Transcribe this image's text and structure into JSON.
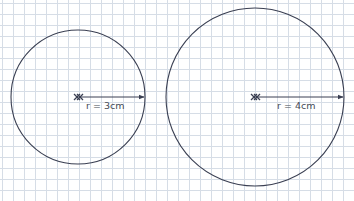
{
  "diagram": {
    "background": "grid-paper",
    "grid_color": "#d6dde6",
    "line_color": "#3a3f52",
    "circles": [
      {
        "name": "small-circle",
        "center": [
          78,
          97
        ],
        "radius_px": 67,
        "radius_label": "r = 3cm",
        "center_marker": "x-mark"
      },
      {
        "name": "large-circle",
        "center": [
          255,
          97
        ],
        "radius_px": 89,
        "radius_label": "r = 4cm",
        "center_marker": "x-mark"
      }
    ]
  }
}
